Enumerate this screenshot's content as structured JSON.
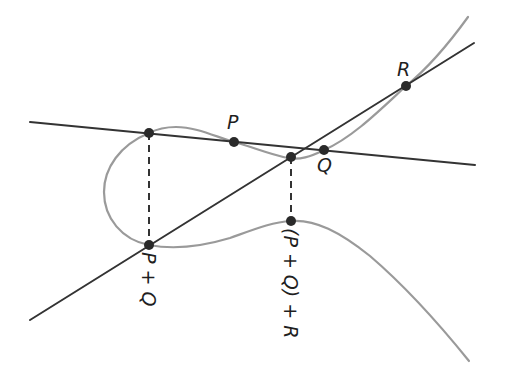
{
  "diagram": {
    "colors": {
      "curve": "#9a9a9a",
      "lines": "#333333",
      "points": "#2a2a2a",
      "labels": "#1f1f1f",
      "background": "#ffffff"
    },
    "labels": {
      "P": "P",
      "Q": "Q",
      "R": "R",
      "P_plus_Q": "P + Q",
      "PQ_plus_R": "(P + Q) + R"
    },
    "points": [
      {
        "name": "third-intersection-PQ",
        "x": 149,
        "y": 133
      },
      {
        "name": "P",
        "x": 234,
        "y": 142
      },
      {
        "name": "Q",
        "x": 324,
        "y": 150
      },
      {
        "name": "R",
        "x": 406,
        "y": 86
      },
      {
        "name": "P+Q",
        "x": 149,
        "y": 245
      },
      {
        "name": "third-intersection-PQR",
        "x": 291,
        "y": 157
      },
      {
        "name": "(P+Q)+R",
        "x": 291,
        "y": 221
      }
    ],
    "lines": [
      {
        "name": "line-through-P-Q",
        "from": [
          30,
          122
        ],
        "to": [
          475,
          165
        ]
      },
      {
        "name": "line-through-PplusQ-R",
        "from": [
          30,
          320
        ],
        "to": [
          474,
          43
        ]
      }
    ],
    "reflections": [
      {
        "name": "reflection-PQ",
        "from": [
          149,
          133
        ],
        "to": [
          149,
          245
        ]
      },
      {
        "name": "reflection-PQR",
        "from": [
          291,
          157
        ],
        "to": [
          291,
          221
        ]
      }
    ]
  }
}
